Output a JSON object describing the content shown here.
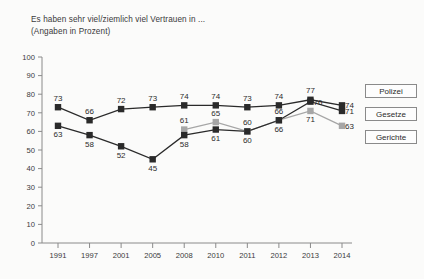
{
  "title": {
    "line1": "Es haben sehr viel/ziemlich viel Vertrauen in ...",
    "line2": "(Angaben in Prozent)"
  },
  "legend": {
    "items": [
      {
        "label": "Polizei",
        "color": "#2a2a2a"
      },
      {
        "label": "Gesetze",
        "color": "#2a2a2a"
      },
      {
        "label": "Gerichte",
        "color": "#a6a6a6"
      }
    ]
  },
  "axis": {
    "y_ticks": [
      "0",
      "10",
      "20",
      "30",
      "40",
      "50",
      "60",
      "70",
      "80",
      "90",
      "100"
    ],
    "x_ticks": [
      "1991",
      "1997",
      "2001",
      "2005",
      "2008",
      "2010",
      "2011",
      "2012",
      "2013",
      "2014"
    ]
  },
  "chart_data": {
    "type": "line",
    "title": "Es haben sehr viel/ziemlich viel Vertrauen in ...",
    "subtitle": "(Angaben in Prozent)",
    "xlabel": "",
    "ylabel": "",
    "ylim": [
      0,
      100
    ],
    "ytick_step": 10,
    "grid": false,
    "legend_position": "right",
    "categories": [
      "1991",
      "1997",
      "2001",
      "2005",
      "2008",
      "2010",
      "2011",
      "2012",
      "2013",
      "2014"
    ],
    "series": [
      {
        "name": "Polizei",
        "color": "#2a2a2a",
        "values": [
          73,
          66,
          72,
          73,
          74,
          74,
          73,
          74,
          77,
          74
        ],
        "label_positions": [
          "above",
          "above",
          "above",
          "above",
          "above",
          "above",
          "above",
          "above",
          "above",
          "right"
        ]
      },
      {
        "name": "Gesetze",
        "color": "#2a2a2a",
        "values": [
          63,
          58,
          52,
          45,
          58,
          61,
          60,
          66,
          76,
          71
        ],
        "label_positions": [
          "below",
          "below",
          "below",
          "below",
          "below",
          "below",
          "below",
          "below",
          "right",
          "right"
        ]
      },
      {
        "name": "Gerichte",
        "color": "#a6a6a6",
        "values": [
          null,
          null,
          null,
          null,
          61,
          65,
          60,
          66,
          71,
          63
        ],
        "label_positions": [
          null,
          null,
          null,
          null,
          "above",
          "above",
          "above",
          "above",
          "below",
          "right"
        ]
      }
    ]
  }
}
